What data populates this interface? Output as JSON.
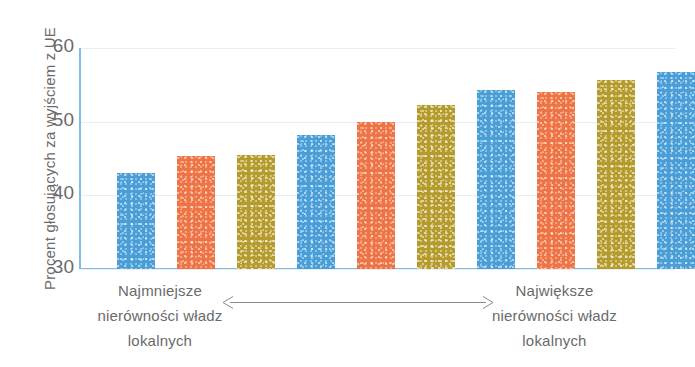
{
  "chart_data": {
    "type": "bar",
    "title": "",
    "xlabel": "",
    "ylabel": "Procent głosujących za wyjściem z UE",
    "ylim": [
      30,
      60
    ],
    "yticks": [
      30,
      40,
      50,
      60
    ],
    "grid": true,
    "legend": "none",
    "categories": [
      "1",
      "2",
      "3",
      "4",
      "5",
      "6",
      "7",
      "8",
      "9",
      "10"
    ],
    "values": [
      43.0,
      45.3,
      45.5,
      48.2,
      50.0,
      52.2,
      54.3,
      54.0,
      55.6,
      56.7
    ],
    "bar_colors": [
      "blue",
      "orange",
      "olive",
      "blue",
      "orange",
      "olive",
      "blue",
      "orange",
      "olive",
      "blue"
    ],
    "annotations": {
      "left_axis_caption": "Najmniejsze nierówności władz lokalnych",
      "right_axis_caption": "Największe nierówności władz lokalnych",
      "range_arrow": "double-headed-arrow"
    }
  },
  "axis": {
    "y_title": "Procent głosujących za wyjściem z UE",
    "tick_labels": [
      "60",
      "50",
      "40",
      "30"
    ]
  },
  "captions": {
    "left": {
      "line1": "Najmniejsze",
      "line2": "nierówności władz",
      "line3": "lokalnych"
    },
    "right": {
      "line1": "Największe",
      "line2": "nierówności władz",
      "line3": "lokalnych"
    }
  },
  "colors": {
    "blue": "#4a9ed8",
    "orange": "#ef7445",
    "olive": "#b59b2b",
    "axis": "#7fbde4",
    "grid": "#e9eef3",
    "text": "#6a6a6a",
    "arrow": "#8b8b8b",
    "background": "#ffffff"
  }
}
